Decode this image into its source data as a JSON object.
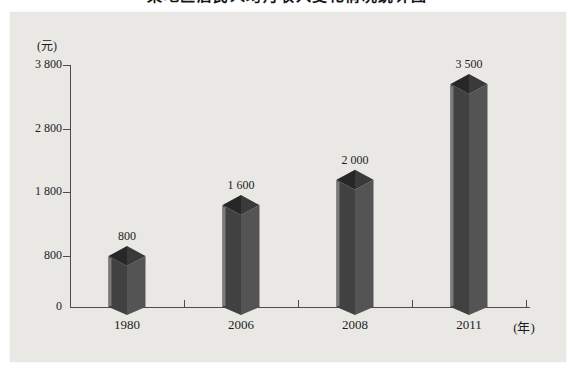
{
  "title": {
    "text": "某地区居民人均月收入变化情况统计图"
  },
  "chart_data": {
    "type": "bar",
    "title": "某地区居民人均月收入变化情况统计图",
    "title_clipped_at_top": true,
    "categories": [
      "1980",
      "2006",
      "2008",
      "2011"
    ],
    "values": [
      800,
      1600,
      2000,
      3500
    ],
    "value_labels": [
      "800",
      "1 600",
      "2 000",
      "3 500"
    ],
    "y_axis": {
      "unit_label": "(元)",
      "range": [
        0,
        3800
      ],
      "ticks": [
        {
          "value": 3800,
          "label": "3 800"
        },
        {
          "value": 2800,
          "label": "2 800"
        },
        {
          "value": 1800,
          "label": "1 800"
        },
        {
          "value": 800,
          "label": "800"
        },
        {
          "value": 0,
          "label": "0"
        }
      ]
    },
    "x_axis": {
      "unit_label": "(年)"
    },
    "bar_style": "3d-column",
    "grid": false,
    "legend": "none",
    "colors": {
      "page_bg": "#ffffff",
      "panel_bg": "#eae8e5",
      "axis": "#4c4c4c",
      "text": "#1c1c1c",
      "bar_left_face": "#414141",
      "bar_right_face": "#545454",
      "bar_left_highlight": "#7b7b7b",
      "bar_top_left": "#272727",
      "bar_top_right": "#3a3a3a"
    }
  }
}
